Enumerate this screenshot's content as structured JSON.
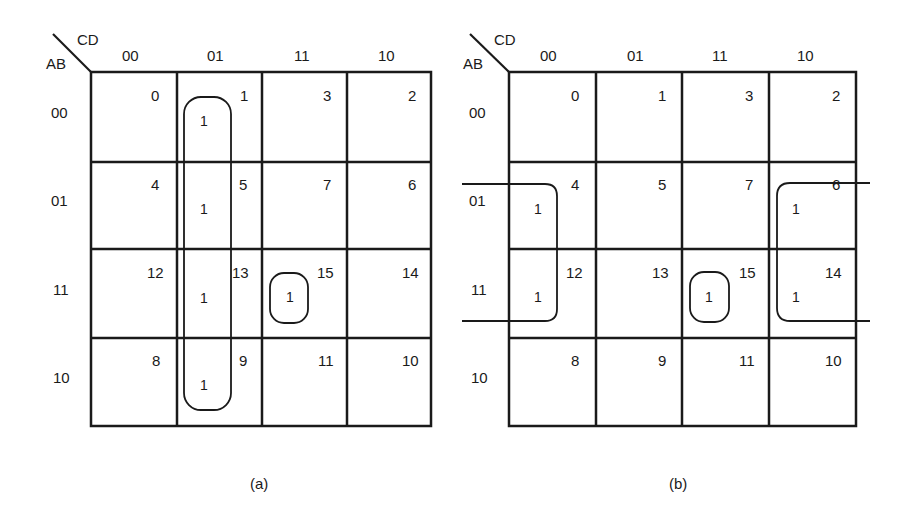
{
  "figure": {
    "colors": {
      "ink": "#1a1a1a",
      "background": "#ffffff"
    }
  },
  "maps": [
    {
      "id": "a",
      "caption": "(a)",
      "row_var": "AB",
      "col_var": "CD",
      "col_labels": [
        "00",
        "01",
        "11",
        "10"
      ],
      "row_labels": [
        "00",
        "01",
        "11",
        "10"
      ],
      "cell_indices": [
        [
          "0",
          "1",
          "3",
          "2"
        ],
        [
          "4",
          "5",
          "7",
          "6"
        ],
        [
          "12",
          "13",
          "15",
          "14"
        ],
        [
          "8",
          "9",
          "11",
          "10"
        ]
      ],
      "ones": [
        {
          "cell": "1",
          "value": "1"
        },
        {
          "cell": "5",
          "value": "1"
        },
        {
          "cell": "13",
          "value": "1"
        },
        {
          "cell": "9",
          "value": "1"
        },
        {
          "cell": "15",
          "value": "1"
        }
      ],
      "groups": [
        {
          "name": "column-01-quad",
          "cells": [
            "1",
            "5",
            "13",
            "9"
          ]
        },
        {
          "name": "single-15",
          "cells": [
            "15"
          ]
        }
      ]
    },
    {
      "id": "b",
      "caption": "(b)",
      "row_var": "AB",
      "col_var": "CD",
      "col_labels": [
        "00",
        "01",
        "11",
        "10"
      ],
      "row_labels": [
        "00",
        "01",
        "11",
        "10"
      ],
      "cell_indices": [
        [
          "0",
          "1",
          "3",
          "2"
        ],
        [
          "4",
          "5",
          "7",
          "6"
        ],
        [
          "12",
          "13",
          "15",
          "14"
        ],
        [
          "8",
          "9",
          "11",
          "10"
        ]
      ],
      "ones": [
        {
          "cell": "4",
          "value": "1"
        },
        {
          "cell": "12",
          "value": "1"
        },
        {
          "cell": "6",
          "value": "1"
        },
        {
          "cell": "14",
          "value": "1"
        },
        {
          "cell": "15",
          "value": "1"
        }
      ],
      "groups": [
        {
          "name": "wraparound-quad",
          "cells": [
            "4",
            "12",
            "6",
            "14"
          ]
        },
        {
          "name": "single-15",
          "cells": [
            "15"
          ]
        }
      ]
    }
  ]
}
